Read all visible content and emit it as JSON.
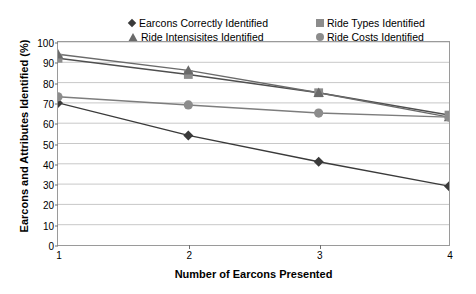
{
  "chart_data": {
    "type": "line",
    "title": "",
    "xlabel": "Number of Earcons Presented",
    "ylabel": "Earcons and Attributes Identified (%)",
    "x": [
      1,
      2,
      3,
      4
    ],
    "xticklabels": [
      "1",
      "2",
      "3",
      "4"
    ],
    "xlim": [
      1,
      4
    ],
    "ylim": [
      0,
      100
    ],
    "yticks": [
      0,
      10,
      20,
      30,
      40,
      50,
      60,
      70,
      80,
      90,
      100
    ],
    "yticklabels": [
      "0",
      "10",
      "20",
      "30",
      "40",
      "50",
      "60",
      "70",
      "80",
      "90",
      "100"
    ],
    "grid": "horizontal",
    "legend_position": "top-center",
    "series": [
      {
        "name": "Earcons Correctly Identified",
        "marker": "diamond",
        "color": "#3a3a3a",
        "line_color": "#3a3a3a",
        "values": [
          70,
          54,
          41,
          29
        ]
      },
      {
        "name": "Ride Types Identified",
        "marker": "square",
        "color": "#8c8c8c",
        "line_color": "#4f4f4f",
        "values": [
          92,
          84,
          75,
          64
        ]
      },
      {
        "name": "Ride Intensisites Identified",
        "marker": "triangle",
        "color": "#6a6a6a",
        "line_color": "#6a6a6a",
        "values": [
          94,
          86,
          75,
          63
        ]
      },
      {
        "name": "Ride Costs Identified",
        "marker": "circle",
        "color": "#8c8c8c",
        "line_color": "#7d7d7d",
        "values": [
          73,
          69,
          65,
          63
        ]
      }
    ]
  }
}
